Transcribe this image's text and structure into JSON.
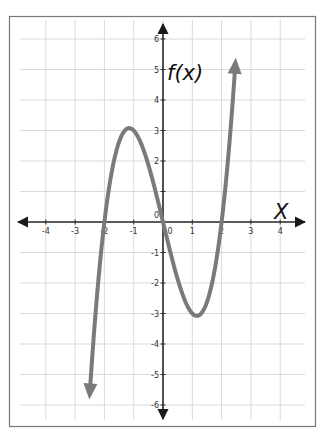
{
  "chart_data": {
    "type": "line",
    "title": "",
    "function_label": "f(x)",
    "xlabel": "X",
    "ylabel": "f(x)",
    "xlim": [
      -4,
      4
    ],
    "ylim": [
      -6,
      6
    ],
    "grid": true,
    "x_ticks": [
      -4,
      -3,
      -2,
      -1,
      0,
      1,
      2,
      3,
      4
    ],
    "y_ticks": [
      -6,
      -5,
      -4,
      -3,
      -2,
      -1,
      0,
      1,
      2,
      3,
      4,
      5,
      6
    ],
    "x_tick_labels": [
      "-4",
      "-3",
      "-2",
      "-1",
      "0",
      "1",
      "2",
      "3",
      "4"
    ],
    "y_tick_labels": [
      "-6",
      "-5",
      "-4",
      "-3",
      "-2",
      "-1",
      "0",
      "2",
      "3",
      "4",
      "5",
      "6"
    ],
    "series": [
      {
        "name": "f(x)",
        "description": "cubic curve, approx f(x) = x^3 - 4x, with arrowheads at both ends",
        "x": [
          -2.5,
          -2.25,
          -2.0,
          -1.75,
          -1.5,
          -1.155,
          -1.0,
          -0.5,
          0.0,
          0.5,
          1.0,
          1.155,
          1.5,
          1.75,
          2.0,
          2.25,
          2.47
        ],
        "y": [
          -5.6,
          -2.4,
          0.0,
          1.6,
          2.6,
          3.08,
          3.0,
          1.9,
          0.0,
          -1.9,
          -3.0,
          -3.08,
          -2.6,
          -1.6,
          0.0,
          2.4,
          6.0
        ],
        "local_max": [
          -1.155,
          3.08
        ],
        "local_min": [
          1.155,
          -3.08
        ],
        "roots": [
          -2,
          0,
          2
        ],
        "color": "#7a7a7a"
      }
    ],
    "legend": null
  },
  "colors": {
    "curve": "#7a7a7a",
    "axis": "#2a2a2a",
    "grid": "#d9d9d9",
    "frame": "#777777"
  }
}
